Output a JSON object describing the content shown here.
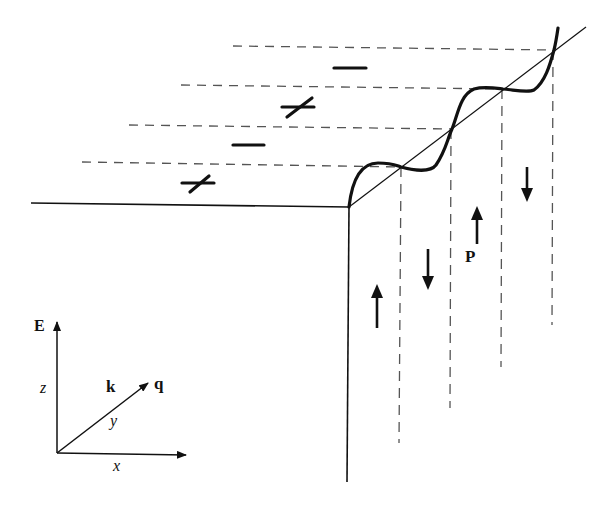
{
  "figure": {
    "labels": {
      "polarization": "P",
      "field": "E",
      "wavevector_k": "k",
      "wavevector_q": "q",
      "axis_x": "x",
      "axis_y": "y",
      "axis_z": "z"
    },
    "surface_charges": [
      "+",
      "−",
      "+",
      "−"
    ],
    "domain_polarization": [
      "up",
      "down",
      "up",
      "down"
    ],
    "colors": {
      "ink": "#111111",
      "dash": "#555555",
      "background": "#ffffff"
    }
  }
}
